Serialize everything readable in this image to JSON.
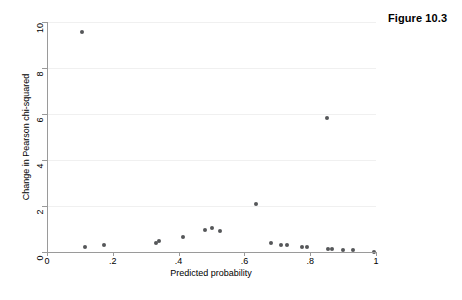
{
  "figure": {
    "caption": "Figure 10.3"
  },
  "chart_data": {
    "type": "scatter",
    "title": "",
    "xlabel": "Predicted probability",
    "ylabel": "Change in Pearson chi-squared",
    "xlim": [
      0,
      1
    ],
    "ylim": [
      0,
      10
    ],
    "grid": true,
    "grid_axis": "y",
    "legend": "none",
    "xticks": [
      0,
      0.2,
      0.4,
      0.6,
      0.8,
      1
    ],
    "xticklabels": [
      "0",
      ".2",
      ".4",
      ".6",
      ".8",
      "1"
    ],
    "yticks": [
      0,
      2,
      4,
      6,
      8,
      10
    ],
    "yticklabels": [
      "0",
      "2",
      "4",
      "6",
      "8",
      "10"
    ],
    "marker_color": "#555759",
    "points": [
      {
        "x": 0.105,
        "y": 9.55
      },
      {
        "x": 0.117,
        "y": 0.23
      },
      {
        "x": 0.173,
        "y": 0.32
      },
      {
        "x": 0.33,
        "y": 0.41
      },
      {
        "x": 0.34,
        "y": 0.46
      },
      {
        "x": 0.412,
        "y": 0.64
      },
      {
        "x": 0.48,
        "y": 0.96
      },
      {
        "x": 0.503,
        "y": 1.05
      },
      {
        "x": 0.525,
        "y": 0.91
      },
      {
        "x": 0.635,
        "y": 2.07
      },
      {
        "x": 0.68,
        "y": 0.41
      },
      {
        "x": 0.71,
        "y": 0.32
      },
      {
        "x": 0.73,
        "y": 0.32
      },
      {
        "x": 0.775,
        "y": 0.23
      },
      {
        "x": 0.79,
        "y": 0.22
      },
      {
        "x": 0.85,
        "y": 5.82
      },
      {
        "x": 0.853,
        "y": 0.13
      },
      {
        "x": 0.866,
        "y": 0.13
      },
      {
        "x": 0.9,
        "y": 0.1
      },
      {
        "x": 0.93,
        "y": 0.07
      },
      {
        "x": 0.995,
        "y": 0.02
      }
    ]
  }
}
